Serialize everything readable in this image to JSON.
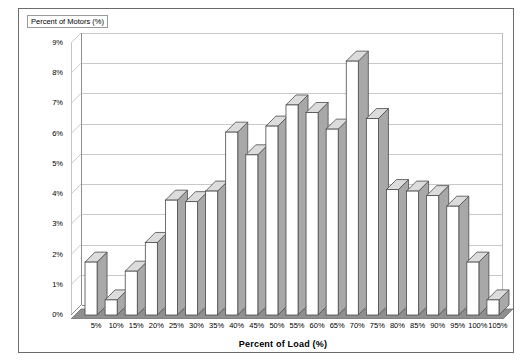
{
  "chart_data": {
    "type": "bar",
    "title": "",
    "xlabel": "Percent of Load  (%)",
    "ylabel": "Percent of Motors (%)",
    "categories": [
      "5%",
      "10%",
      "15%",
      "20%",
      "25%",
      "30%",
      "35%",
      "40%",
      "45%",
      "50%",
      "55%",
      "60%",
      "65%",
      "70%",
      "75%",
      "80%",
      "85%",
      "90%",
      "95%",
      "100%",
      "105%"
    ],
    "values": [
      1.75,
      0.5,
      1.45,
      2.4,
      3.8,
      3.75,
      4.1,
      6.05,
      5.3,
      6.25,
      6.95,
      6.7,
      6.15,
      8.4,
      6.5,
      4.15,
      4.1,
      3.95,
      3.6,
      1.75,
      0.5
    ],
    "ylim": [
      0,
      9
    ],
    "ytick_labels": [
      "9%",
      "8%",
      "7%",
      "6%",
      "5%",
      "4%",
      "3%",
      "2%",
      "1%",
      "0%"
    ],
    "ytick_values": [
      9,
      8,
      7,
      6,
      5,
      4,
      3,
      2,
      1,
      0
    ],
    "grid": true,
    "legend": false,
    "style": "3d-column",
    "colors": {
      "bar_face": "#ffffff",
      "bar_side": "#a8a8a8",
      "bar_outline": "#4a4a4a",
      "gridline": "#c9c9c9",
      "axis": "#8d8d8d",
      "floor": "#8f8f8f",
      "frame": "#6b6b6b",
      "text": "#000000"
    }
  }
}
